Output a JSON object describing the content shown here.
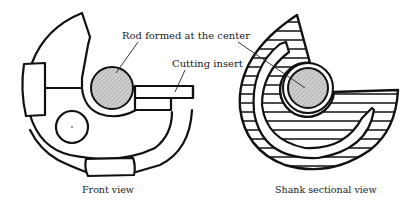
{
  "figure": {
    "views": [
      {
        "id": "front",
        "caption": "Front view"
      },
      {
        "id": "shank",
        "caption": "Shank sectional view"
      }
    ],
    "callouts": {
      "rod": "Rod formed at the center",
      "insert": "Cutting insert"
    },
    "colors": {
      "stroke": "#111111",
      "rod_fill": "#c8c8c8",
      "background": "#ffffff"
    }
  }
}
